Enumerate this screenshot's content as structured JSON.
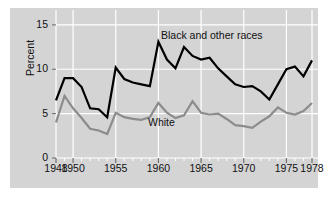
{
  "figure": {
    "background_color": "#ffffff",
    "panel_color": "#d4d4d4",
    "grid_color": "#ffffff"
  },
  "chart_data": {
    "type": "line",
    "title": "",
    "xlabel": "",
    "ylabel": "Percent",
    "xlim": [
      1948,
      1978
    ],
    "ylim": [
      0,
      16
    ],
    "yticks": [
      0,
      5,
      10,
      15
    ],
    "xticks": [
      1948,
      1950,
      1955,
      1960,
      1965,
      1970,
      1975,
      1978
    ],
    "xtick_labels": [
      "1948",
      "1950",
      "1955",
      "1960",
      "1965",
      "1970",
      "1975",
      "1978"
    ],
    "ytick_labels": [
      "0",
      "5",
      "10",
      "15"
    ],
    "minor_xtick_interval": 1,
    "grid": true,
    "grid_axes": "both",
    "legend": "inline-annotations",
    "x": [
      1948,
      1949,
      1950,
      1951,
      1952,
      1953,
      1954,
      1955,
      1956,
      1957,
      1958,
      1959,
      1960,
      1961,
      1962,
      1963,
      1964,
      1965,
      1966,
      1967,
      1968,
      1969,
      1970,
      1971,
      1972,
      1973,
      1974,
      1975,
      1976,
      1977,
      1978
    ],
    "series": [
      {
        "name": "Black and other races",
        "color": "#000000",
        "line_width": 2.2,
        "label_position": {
          "x": 1962.0,
          "y": 13.6
        },
        "values": [
          6.5,
          9.0,
          9.0,
          8.0,
          5.6,
          5.5,
          4.6,
          10.2,
          8.9,
          8.5,
          8.3,
          8.1,
          13.1,
          11.1,
          10.1,
          12.5,
          11.5,
          11.1,
          11.3,
          10.1,
          9.2,
          8.3,
          8.0,
          8.1,
          7.5,
          6.6,
          8.3,
          10.0,
          10.3,
          9.2,
          11.0
        ]
      },
      {
        "name": "White",
        "color": "#8c8c8c",
        "line_width": 2.2,
        "label_position": {
          "x": 1958.9,
          "y": 4.0
        },
        "values": [
          4.0,
          7.0,
          5.6,
          4.5,
          3.3,
          3.1,
          2.7,
          5.1,
          4.6,
          4.4,
          4.3,
          4.6,
          6.2,
          5.1,
          4.5,
          4.8,
          6.4,
          5.1,
          4.9,
          5.0,
          4.4,
          3.7,
          3.6,
          3.4,
          4.1,
          4.7,
          5.7,
          5.1,
          4.9,
          5.3,
          6.2
        ]
      }
    ],
    "series_continued_note": ""
  },
  "annotations": {
    "black_label": "Black and other races",
    "white_label": "White",
    "ylabel_text": "Percent"
  }
}
